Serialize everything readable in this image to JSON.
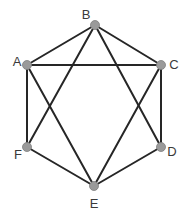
{
  "diagram": {
    "type": "graph",
    "nodes": [
      {
        "id": "A",
        "label": "A",
        "x": 27,
        "y": 65,
        "lx": 17,
        "ly": 63,
        "anchor": "middle"
      },
      {
        "id": "B",
        "label": "B",
        "x": 95,
        "y": 25,
        "lx": 86,
        "ly": 16,
        "anchor": "middle"
      },
      {
        "id": "C",
        "label": "C",
        "x": 161,
        "y": 65,
        "lx": 174,
        "ly": 66,
        "anchor": "middle"
      },
      {
        "id": "D",
        "label": "D",
        "x": 161,
        "y": 147,
        "lx": 172,
        "ly": 153,
        "anchor": "middle"
      },
      {
        "id": "E",
        "label": "E",
        "x": 94,
        "y": 186,
        "lx": 94,
        "ly": 205,
        "anchor": "middle"
      },
      {
        "id": "F",
        "label": "F",
        "x": 27,
        "y": 147,
        "lx": 18,
        "ly": 156,
        "anchor": "middle"
      }
    ],
    "edges": [
      [
        "A",
        "B"
      ],
      [
        "B",
        "C"
      ],
      [
        "A",
        "C"
      ],
      [
        "A",
        "F"
      ],
      [
        "A",
        "E"
      ],
      [
        "B",
        "F"
      ],
      [
        "B",
        "D"
      ],
      [
        "C",
        "D"
      ],
      [
        "C",
        "E"
      ],
      [
        "F",
        "E"
      ],
      [
        "D",
        "E"
      ]
    ],
    "colors": {
      "edge": "#262626",
      "node_fill": "#9a9a9a",
      "label": "#3a3a3a",
      "background": "#ffffff"
    }
  }
}
